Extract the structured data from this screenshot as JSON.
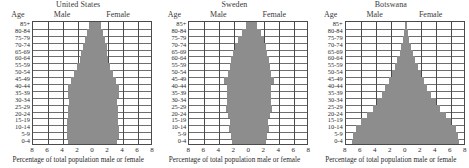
{
  "figure": {
    "caption": "Percentage of total population male or female",
    "column_headers": {
      "age": "Age",
      "male": "Male",
      "female": "Female"
    },
    "fill_color": "#8d8d8d",
    "grid_color": "#4a4a4a"
  },
  "chart_data": [
    {
      "type": "bar",
      "title": "United States",
      "orientation": "population-pyramid",
      "xlabel": "Percentage of total population male or female",
      "ylabel": "Age",
      "xlim": [
        -8,
        8
      ],
      "xticks": [
        "8",
        "6",
        "4",
        "2",
        "0",
        "2",
        "4",
        "6",
        "8"
      ],
      "grid": true,
      "legend": [
        "Male",
        "Female"
      ],
      "categories": [
        "85+",
        "80-84",
        "75-79",
        "70-74",
        "65-69",
        "60-64",
        "55-59",
        "50-54",
        "45-49",
        "40-44",
        "35-39",
        "30-34",
        "25-29",
        "20-24",
        "15-19",
        "10-14",
        "5-9",
        "0-4"
      ],
      "series": [
        {
          "name": "Male",
          "values": [
            0.5,
            0.8,
            1.1,
            1.4,
            1.6,
            1.8,
            2.2,
            2.6,
            3.0,
            3.3,
            3.3,
            3.2,
            3.4,
            3.4,
            3.5,
            3.5,
            3.5,
            3.4
          ]
        },
        {
          "name": "Female",
          "values": [
            1.0,
            1.3,
            1.6,
            1.8,
            1.9,
            2.0,
            2.3,
            2.7,
            3.1,
            3.4,
            3.4,
            3.2,
            3.3,
            3.3,
            3.3,
            3.4,
            3.4,
            3.2
          ]
        }
      ]
    },
    {
      "type": "bar",
      "title": "Sweden",
      "orientation": "population-pyramid",
      "xlabel": "Percentage of total population male or female",
      "ylabel": "Age",
      "xlim": [
        -8,
        8
      ],
      "xticks": [
        "8",
        "6",
        "4",
        "2",
        "0",
        "2",
        "4",
        "6",
        "8"
      ],
      "grid": true,
      "legend": [
        "Male",
        "Female"
      ],
      "categories": [
        "85+",
        "80-84",
        "75-79",
        "70-74",
        "65-69",
        "60-64",
        "55-59",
        "50-54",
        "45-49",
        "40-44",
        "35-39",
        "30-34",
        "25-29",
        "20-24",
        "15-19",
        "10-14",
        "5-9",
        "0-4"
      ],
      "series": [
        {
          "name": "Male",
          "values": [
            0.5,
            1.0,
            1.5,
            1.9,
            2.2,
            2.5,
            2.6,
            2.8,
            3.4,
            3.0,
            3.0,
            3.0,
            3.1,
            2.8,
            2.6,
            2.7,
            2.4,
            2.3
          ]
        },
        {
          "name": "Female",
          "values": [
            1.0,
            1.5,
            1.9,
            2.2,
            2.4,
            2.6,
            2.7,
            2.9,
            3.3,
            2.9,
            2.9,
            2.9,
            3.0,
            2.7,
            2.5,
            2.6,
            2.3,
            2.2
          ]
        }
      ]
    },
    {
      "type": "bar",
      "title": "Botswana",
      "orientation": "population-pyramid",
      "xlabel": "Percentage of total population male or female",
      "ylabel": "Age",
      "xlim": [
        -8,
        8
      ],
      "xticks": [
        "8",
        "6",
        "4",
        "2",
        "0",
        "2",
        "4",
        "6",
        "8"
      ],
      "grid": true,
      "legend": [
        "Male",
        "Female"
      ],
      "categories": [
        "85+",
        "80-84",
        "75-79",
        "70-74",
        "65-69",
        "60-64",
        "55-59",
        "50-54",
        "45-49",
        "40-44",
        "35-39",
        "30-34",
        "25-29",
        "20-24",
        "15-19",
        "10-14",
        "5-9",
        "0-4"
      ],
      "series": [
        {
          "name": "Male",
          "values": [
            0.15,
            0.25,
            0.4,
            0.6,
            0.8,
            1.1,
            1.4,
            1.8,
            2.2,
            2.7,
            3.2,
            3.8,
            4.4,
            5.2,
            6.0,
            6.6,
            7.0,
            7.1
          ]
        },
        {
          "name": "Female",
          "values": [
            0.2,
            0.3,
            0.5,
            0.7,
            0.95,
            1.3,
            1.6,
            2.0,
            2.4,
            2.9,
            3.4,
            4.0,
            4.6,
            5.4,
            6.1,
            6.7,
            7.0,
            7.1
          ]
        }
      ]
    }
  ]
}
